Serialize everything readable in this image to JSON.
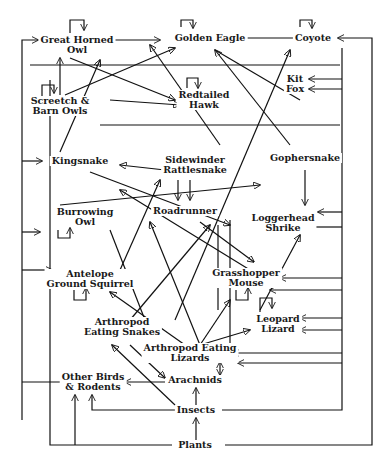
{
  "diagram": {
    "type": "food-web",
    "nodes": [
      {
        "id": "great_horned_owl",
        "line1": "Great Horned",
        "line2": "Owl",
        "x": 77,
        "y": 45
      },
      {
        "id": "golden_eagle",
        "line1": "Golden Eagle",
        "line2": "",
        "x": 210,
        "y": 38
      },
      {
        "id": "coyote",
        "line1": "Coyote",
        "line2": "",
        "x": 313,
        "y": 38
      },
      {
        "id": "kit_fox",
        "line1": "Kit",
        "line2": "Fox",
        "x": 295,
        "y": 82
      },
      {
        "id": "screetch_barn_owls",
        "line1": "Screetch &",
        "line2": "Barn Owls",
        "x": 60,
        "y": 106
      },
      {
        "id": "redtailed_hawk",
        "line1": "Redtailed",
        "line2": "Hawk",
        "x": 204,
        "y": 100
      },
      {
        "id": "kingsnake",
        "line1": "Kingsnake",
        "line2": "",
        "x": 80,
        "y": 161
      },
      {
        "id": "sidewinder_rattlesnake",
        "line1": "Sidewinder",
        "line2": "Rattlesnake",
        "x": 195,
        "y": 165
      },
      {
        "id": "gophersnake",
        "line1": "Gophersnake",
        "line2": "",
        "x": 305,
        "y": 158
      },
      {
        "id": "burrowing_owl",
        "line1": "Burrowing",
        "line2": "Owl",
        "x": 85,
        "y": 213
      },
      {
        "id": "roadrunner",
        "line1": "Roadrunner",
        "line2": "",
        "x": 185,
        "y": 210
      },
      {
        "id": "loggerhead_shrike",
        "line1": "Loggerhead",
        "line2": "Shrike",
        "x": 283,
        "y": 223
      },
      {
        "id": "antelope_ground_squirrel",
        "line1": "Antelope",
        "line2": "Ground Squirrel",
        "x": 90,
        "y": 279
      },
      {
        "id": "grasshopper_mouse",
        "line1": "Grasshopper",
        "line2": "Mouse",
        "x": 246,
        "y": 278
      },
      {
        "id": "arthropod_eating_snakes",
        "line1": "Arthropod",
        "line2": "Eating Snakes",
        "x": 122,
        "y": 327
      },
      {
        "id": "leopard_lizard",
        "line1": "Leopard",
        "line2": "Lizard",
        "x": 278,
        "y": 322
      },
      {
        "id": "arthropod_eating_lizards",
        "line1": "Arthropod Eating",
        "line2": "Lizards",
        "x": 190,
        "y": 353
      },
      {
        "id": "other_birds_rodents",
        "line1": "Other Birds",
        "line2": "& Rodents",
        "x": 93,
        "y": 382
      },
      {
        "id": "arachnids",
        "line1": "Arachnids",
        "line2": "",
        "x": 195,
        "y": 380
      },
      {
        "id": "insects",
        "line1": "Insects",
        "line2": "",
        "x": 196,
        "y": 410
      },
      {
        "id": "plants",
        "line1": "Plants",
        "line2": "",
        "x": 195,
        "y": 445
      }
    ]
  }
}
